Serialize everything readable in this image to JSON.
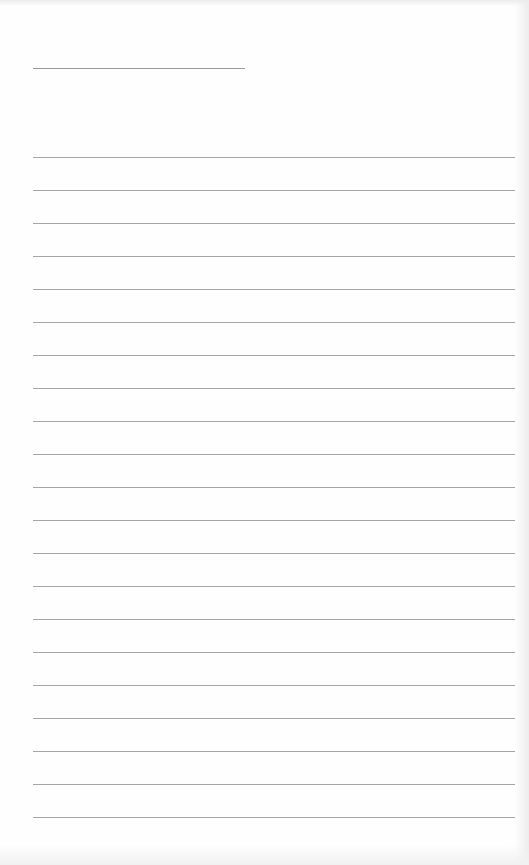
{
  "page": {
    "type": "lined-paper",
    "background_color": "#fefefe",
    "line_color": "#a6a6a6",
    "header_line": {
      "x": 33,
      "y": 68,
      "width": 212
    },
    "ruled_lines": {
      "count": 21,
      "x": 33,
      "width": 482,
      "first_y": 157,
      "spacing": 33
    }
  }
}
